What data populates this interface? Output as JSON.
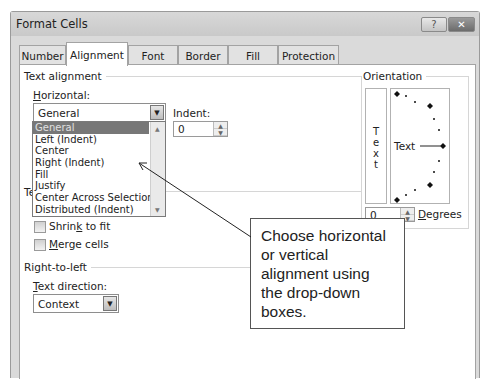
{
  "window": {
    "title": "Format Cells",
    "help_label": "?",
    "close_label": "✕"
  },
  "tabs": [
    {
      "label": "Number",
      "active": false
    },
    {
      "label": "Alignment",
      "active": true
    },
    {
      "label": "Font",
      "active": false
    },
    {
      "label": "Border",
      "active": false
    },
    {
      "label": "Fill",
      "active": false
    },
    {
      "label": "Protection",
      "active": false
    }
  ],
  "text_alignment": {
    "group_label": "Text alignment",
    "horizontal_label_access": "H",
    "horizontal_label_rest": "orizontal:",
    "horizontal_value": "General",
    "horizontal_options": [
      "General",
      "Left (Indent)",
      "Center",
      "Right (Indent)",
      "Fill",
      "Justify",
      "Center Across Selection",
      "Distributed (Indent)"
    ],
    "horizontal_selected_index": 0,
    "indent_label": "Indent:",
    "indent_value": "0",
    "hidden_group_label_fragment": "Te"
  },
  "text_control": {
    "shrink_label_pre": "Shrin",
    "shrink_label_access": "k",
    "shrink_label_post": " to fit",
    "merge_label_access": "M",
    "merge_label_post": "erge cells"
  },
  "right_to_left": {
    "group_label": "Right-to-left",
    "direction_label_access": "T",
    "direction_label_rest": "ext direction:",
    "direction_value": "Context"
  },
  "orientation": {
    "group_label": "Orientation",
    "vertical_text_letters": [
      "T",
      "e",
      "x",
      "t"
    ],
    "dial_text": "Text",
    "degrees_value": "0",
    "degrees_label_access": "D",
    "degrees_label_rest": "egrees"
  },
  "callout": {
    "text": "Choose horizontal or vertical alignment using the drop-down boxes."
  },
  "colors": {
    "selected_item_bg": "#777777",
    "close_button_bg": "#7a7a7a",
    "dialog_bg": "#dadada"
  }
}
